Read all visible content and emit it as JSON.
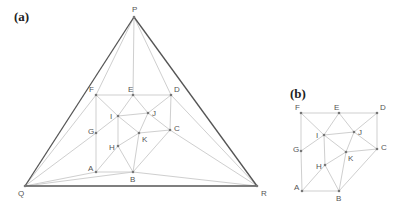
{
  "panels": [
    {
      "id": "a",
      "label": "(a)",
      "label_pos": [
        14,
        21
      ],
      "nodes": {
        "P": {
          "x": 134,
          "y": 17,
          "lx": 132,
          "ly": 12
        },
        "Q": {
          "x": 25,
          "y": 186,
          "lx": 18,
          "ly": 196
        },
        "R": {
          "x": 257,
          "y": 186,
          "lx": 261,
          "ly": 196
        },
        "F": {
          "x": 96,
          "y": 95,
          "lx": 89,
          "ly": 92
        },
        "E": {
          "x": 133,
          "y": 95,
          "lx": 128,
          "ly": 92
        },
        "D": {
          "x": 171,
          "y": 95,
          "lx": 174,
          "ly": 92
        },
        "I": {
          "x": 118,
          "y": 116,
          "lx": 110,
          "ly": 119
        },
        "J": {
          "x": 148,
          "y": 113,
          "lx": 152,
          "ly": 116
        },
        "G": {
          "x": 96,
          "y": 133,
          "lx": 88,
          "ly": 134
        },
        "C": {
          "x": 170,
          "y": 130,
          "lx": 174,
          "ly": 131
        },
        "K": {
          "x": 139,
          "y": 133,
          "lx": 142,
          "ly": 142
        },
        "H": {
          "x": 118,
          "y": 146,
          "lx": 109,
          "ly": 150
        },
        "A": {
          "x": 96,
          "y": 172,
          "lx": 88,
          "ly": 171
        },
        "B": {
          "x": 133,
          "y": 172,
          "lx": 130,
          "ly": 182
        }
      },
      "dark_edges": [
        [
          "P",
          "Q"
        ],
        [
          "Q",
          "R"
        ],
        [
          "P",
          "R"
        ]
      ],
      "light_edges": [
        [
          "P",
          "F"
        ],
        [
          "P",
          "E"
        ],
        [
          "P",
          "D"
        ],
        [
          "Q",
          "F"
        ],
        [
          "Q",
          "G"
        ],
        [
          "Q",
          "A"
        ],
        [
          "Q",
          "B"
        ],
        [
          "R",
          "D"
        ],
        [
          "R",
          "C"
        ],
        [
          "R",
          "B"
        ],
        [
          "F",
          "E"
        ],
        [
          "E",
          "D"
        ],
        [
          "F",
          "G"
        ],
        [
          "G",
          "A"
        ],
        [
          "A",
          "B"
        ],
        [
          "D",
          "C"
        ],
        [
          "C",
          "B"
        ],
        [
          "F",
          "I"
        ],
        [
          "E",
          "I"
        ],
        [
          "E",
          "J"
        ],
        [
          "D",
          "J"
        ],
        [
          "I",
          "J"
        ],
        [
          "G",
          "I"
        ],
        [
          "I",
          "H"
        ],
        [
          "I",
          "K"
        ],
        [
          "H",
          "K"
        ],
        [
          "A",
          "H"
        ],
        [
          "H",
          "B"
        ],
        [
          "K",
          "B"
        ],
        [
          "K",
          "J"
        ],
        [
          "K",
          "C"
        ],
        [
          "J",
          "C"
        ]
      ]
    },
    {
      "id": "b",
      "label": "(b)",
      "label_pos": [
        290,
        98
      ],
      "nodes": {
        "F": {
          "x": 301,
          "y": 113,
          "lx": 295,
          "ly": 110
        },
        "E": {
          "x": 339,
          "y": 113,
          "lx": 334,
          "ly": 110
        },
        "D": {
          "x": 377,
          "y": 113,
          "lx": 380,
          "ly": 110
        },
        "I": {
          "x": 324,
          "y": 135,
          "lx": 316,
          "ly": 138
        },
        "J": {
          "x": 354,
          "y": 132,
          "lx": 358,
          "ly": 135
        },
        "G": {
          "x": 301,
          "y": 151,
          "lx": 293,
          "ly": 152
        },
        "C": {
          "x": 377,
          "y": 149,
          "lx": 381,
          "ly": 150
        },
        "K": {
          "x": 346,
          "y": 152,
          "lx": 348,
          "ly": 161
        },
        "H": {
          "x": 325,
          "y": 165,
          "lx": 316,
          "ly": 169
        },
        "A": {
          "x": 302,
          "y": 191,
          "lx": 294,
          "ly": 190
        },
        "B": {
          "x": 339,
          "y": 191,
          "lx": 336,
          "ly": 201
        }
      },
      "dark_edges": [],
      "light_edges": [
        [
          "F",
          "E"
        ],
        [
          "E",
          "D"
        ],
        [
          "F",
          "G"
        ],
        [
          "G",
          "A"
        ],
        [
          "A",
          "B"
        ],
        [
          "D",
          "C"
        ],
        [
          "C",
          "B"
        ],
        [
          "F",
          "I"
        ],
        [
          "E",
          "I"
        ],
        [
          "E",
          "J"
        ],
        [
          "D",
          "J"
        ],
        [
          "I",
          "J"
        ],
        [
          "G",
          "I"
        ],
        [
          "I",
          "H"
        ],
        [
          "I",
          "K"
        ],
        [
          "H",
          "K"
        ],
        [
          "A",
          "H"
        ],
        [
          "H",
          "B"
        ],
        [
          "K",
          "B"
        ],
        [
          "K",
          "J"
        ],
        [
          "K",
          "C"
        ],
        [
          "J",
          "C"
        ]
      ]
    }
  ]
}
